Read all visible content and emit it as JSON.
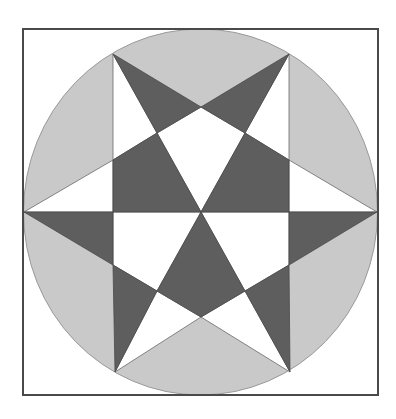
{
  "figure": {
    "colors": {
      "background": "#ffffff",
      "frame": "#4a4a4a",
      "light_gray": "#c9c9c9",
      "dark_gray": "#5e5e5e",
      "white": "#ffffff"
    },
    "frame": {
      "x": 23,
      "y": 29,
      "width": 355,
      "height": 366
    },
    "ellipse": {
      "cx": 200.5,
      "cy": 212,
      "rx": 177,
      "ry": 183
    },
    "vertices": {
      "top_left": [
        113,
        54
      ],
      "top_right": [
        289,
        54
      ],
      "left": [
        24,
        212
      ],
      "right": [
        377,
        212
      ],
      "bottom_left": [
        115,
        372
      ],
      "bottom_right": [
        290,
        372
      ],
      "center": [
        201,
        212
      ]
    }
  }
}
